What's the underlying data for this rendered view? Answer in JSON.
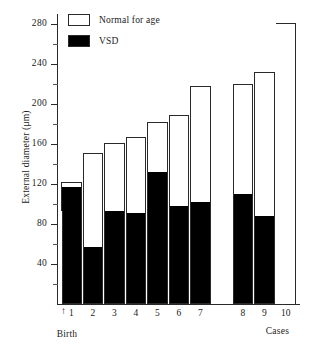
{
  "axes": {
    "ylabel": "External diameter (μm)",
    "xlabel": "Cases",
    "birth_label": "Birth",
    "birth_arrow": "↑",
    "unknown_marker": "?",
    "yticks": [
      280,
      240,
      200,
      160,
      120,
      80,
      40
    ],
    "ytick_labels": [
      "280",
      "240",
      "200",
      "160",
      "120",
      "80",
      "40"
    ],
    "yminor": [
      260,
      220,
      180,
      140,
      100,
      60,
      20
    ],
    "ylim": [
      0,
      290
    ],
    "xtick_labels": [
      "1",
      "2",
      "3",
      "4",
      "5",
      "6",
      "7",
      "8",
      "9",
      "10"
    ]
  },
  "legend": {
    "position": "top-left-inside",
    "entries": [
      {
        "label": "Normal for age",
        "swatch": "white",
        "color": "#ffffff"
      },
      {
        "label": "VSD",
        "swatch": "black",
        "color": "#000000"
      }
    ]
  },
  "reference": {
    "name": "birth-level",
    "value": 93
  },
  "chart_data": {
    "type": "bar",
    "title": "",
    "subtitle": "",
    "xlabel": "Cases",
    "ylabel": "External diameter (μm)",
    "ylim": [
      0,
      290
    ],
    "grid": false,
    "stacked": true,
    "legend_position": "top-left-inside",
    "annotations": [
      {
        "text": "Birth",
        "type": "axis-marker",
        "value": 93
      },
      {
        "text": "?",
        "type": "missing-value",
        "case": "10",
        "series": "VSD"
      }
    ],
    "categories": [
      "1",
      "2",
      "3",
      "4",
      "5",
      "6",
      "7",
      "8",
      "9",
      "10"
    ],
    "series": [
      {
        "name": "VSD",
        "color": "#000000",
        "values": [
          117,
          57,
          93,
          91,
          132,
          98,
          102,
          110,
          88,
          null
        ]
      },
      {
        "name": "Normal for age",
        "color": "#ffffff",
        "values": [
          122,
          151,
          161,
          167,
          182,
          189,
          218,
          220,
          232,
          281
        ]
      }
    ],
    "reference_line": {
      "label": "Birth",
      "value": 93
    }
  }
}
